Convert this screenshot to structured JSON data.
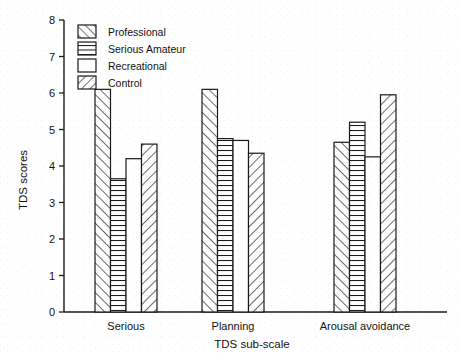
{
  "chart_data": {
    "type": "bar",
    "title": "",
    "xlabel": "TDS sub-scale",
    "ylabel": "TDS scores",
    "ylim": [
      0,
      8
    ],
    "ytick_labels": [
      "0",
      "1",
      "2",
      "3",
      "4",
      "5",
      "6",
      "7",
      "8"
    ],
    "grid": false,
    "legend_position": "top-left inside axes",
    "categories": [
      "Serious",
      "Planning",
      "Arousal avoidance"
    ],
    "series": [
      {
        "name": "Professional",
        "pattern": "forward-diagonal",
        "values": [
          6.1,
          6.1,
          4.65
        ]
      },
      {
        "name": "Serious Amateur",
        "pattern": "horizontal-lines",
        "values": [
          3.65,
          4.75,
          5.2
        ]
      },
      {
        "name": "Recreational",
        "pattern": "blank",
        "values": [
          4.2,
          4.7,
          4.25
        ]
      },
      {
        "name": "Control",
        "pattern": "backward-diagonal",
        "values": [
          4.6,
          4.35,
          5.95
        ]
      }
    ]
  },
  "legend": {
    "items": [
      {
        "label": "Professional"
      },
      {
        "label": "Serious Amateur"
      },
      {
        "label": "Recreational"
      },
      {
        "label": "Control"
      }
    ]
  },
  "axes": {
    "y_title": "TDS scores",
    "x_title": "TDS sub-scale"
  }
}
